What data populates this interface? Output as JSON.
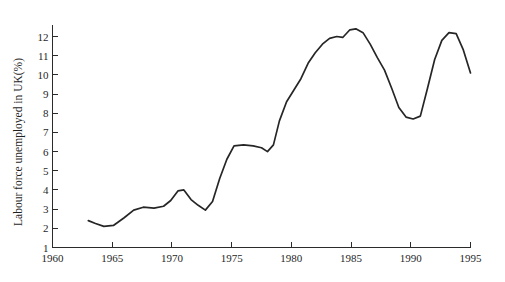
{
  "chart_data": {
    "type": "line",
    "title": "",
    "subtitle": "",
    "xlabel": "",
    "ylabel": "Labour force unemployed in UK(%)",
    "xlim": [
      1960,
      1995
    ],
    "ylim": [
      1,
      12
    ],
    "grid": false,
    "legend": null,
    "xticks": [
      1960,
      1965,
      1970,
      1975,
      1980,
      1985,
      1990,
      1995
    ],
    "xtick_labels": [
      "1960",
      "1965",
      "1970",
      "1975",
      "1980",
      "1985",
      "1990",
      "1995"
    ],
    "yticks": [
      1,
      2,
      3,
      4,
      5,
      6,
      7,
      8,
      9,
      10,
      11,
      12
    ],
    "ytick_labels": [
      "1",
      "2",
      "3",
      "4",
      "5",
      "6",
      "7",
      "8",
      "9",
      "10",
      "11",
      "12"
    ],
    "series": [
      {
        "name": "Labour force unemployed in UK(%)",
        "color": "#262626",
        "x": [
          1963.0,
          1963.6,
          1964.3,
          1965.1,
          1966.0,
          1966.8,
          1967.6,
          1968.5,
          1969.3,
          1969.9,
          1970.5,
          1971.0,
          1971.6,
          1972.2,
          1972.8,
          1973.4,
          1974.0,
          1974.6,
          1975.2,
          1976.0,
          1976.8,
          1977.5,
          1978.0,
          1978.5,
          1979.0,
          1979.6,
          1980.2,
          1980.8,
          1981.4,
          1982.0,
          1982.6,
          1983.2,
          1983.8,
          1984.3,
          1984.9,
          1985.4,
          1986.0,
          1986.6,
          1987.2,
          1987.8,
          1988.4,
          1989.0,
          1989.6,
          1990.2,
          1990.8,
          1991.4,
          1992.0,
          1992.6,
          1993.2,
          1993.8,
          1994.4,
          1995.0
        ],
        "y": [
          2.4,
          2.25,
          2.1,
          2.15,
          2.55,
          2.95,
          3.1,
          3.05,
          3.15,
          3.45,
          3.95,
          4.0,
          3.5,
          3.2,
          2.95,
          3.4,
          4.6,
          5.6,
          6.3,
          6.35,
          6.3,
          6.2,
          6.0,
          6.35,
          7.6,
          8.6,
          9.2,
          9.8,
          10.6,
          11.15,
          11.6,
          11.9,
          12.0,
          11.95,
          12.35,
          12.4,
          12.2,
          11.6,
          10.9,
          10.25,
          9.3,
          8.3,
          7.8,
          7.7,
          7.85,
          9.3,
          10.8,
          11.8,
          12.2,
          12.15,
          11.3,
          10.1
        ]
      }
    ]
  }
}
